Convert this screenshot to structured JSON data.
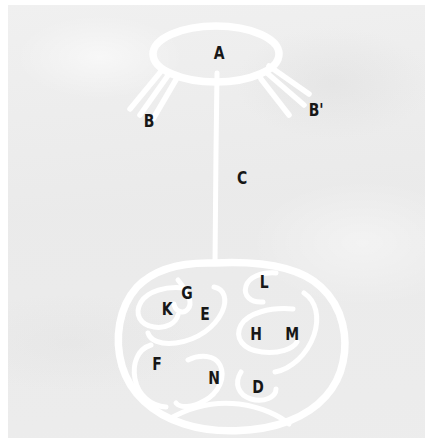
{
  "figure": {
    "background_color": "#ebebeb",
    "plate_border_color": "#ffffff",
    "stroke_color": "#ffffff",
    "label_color": "#171717",
    "title": "",
    "caption": ""
  },
  "structures": {
    "upper_body": {
      "name": "upper-ellipse",
      "label": "A"
    },
    "left_radiating_lines": {
      "name": "left-radiating-lines",
      "label": "B",
      "count": 3
    },
    "right_radiating_lines": {
      "name": "right-radiating-lines",
      "label": "B'",
      "count": 3
    },
    "connecting_stalk": {
      "name": "connecting-stalk",
      "label": "C"
    },
    "lower_body": {
      "name": "lower-oval",
      "label": ""
    }
  },
  "labels": [
    {
      "id": "A",
      "text": "A",
      "x": 210,
      "y": 47,
      "target": "upper-ellipse"
    },
    {
      "id": "B",
      "text": "B",
      "x": 140,
      "y": 115,
      "target": "left-radiating-lines"
    },
    {
      "id": "Bp",
      "text": "B'",
      "x": 305,
      "y": 104,
      "target": "right-radiating-lines"
    },
    {
      "id": "C",
      "text": "C",
      "x": 233,
      "y": 172,
      "target": "connecting-stalk"
    },
    {
      "id": "L",
      "text": "L",
      "x": 255,
      "y": 276,
      "target": "lower-oval-region-L"
    },
    {
      "id": "G",
      "text": "G",
      "x": 178,
      "y": 287,
      "target": "lower-oval-region-G"
    },
    {
      "id": "K",
      "text": "K",
      "x": 158,
      "y": 303,
      "target": "lower-oval-region-K"
    },
    {
      "id": "E",
      "text": "E",
      "x": 196,
      "y": 308,
      "target": "lower-oval-region-E"
    },
    {
      "id": "H",
      "text": "H",
      "x": 247,
      "y": 328,
      "target": "lower-oval-region-H"
    },
    {
      "id": "M",
      "text": "M",
      "x": 283,
      "y": 328,
      "target": "lower-oval-region-M"
    },
    {
      "id": "F",
      "text": "F",
      "x": 148,
      "y": 358,
      "target": "lower-oval-region-F"
    },
    {
      "id": "N",
      "text": "N",
      "x": 205,
      "y": 372,
      "target": "lower-oval-region-N"
    },
    {
      "id": "D",
      "text": "D",
      "x": 249,
      "y": 381,
      "target": "lower-oval-region-D"
    }
  ]
}
